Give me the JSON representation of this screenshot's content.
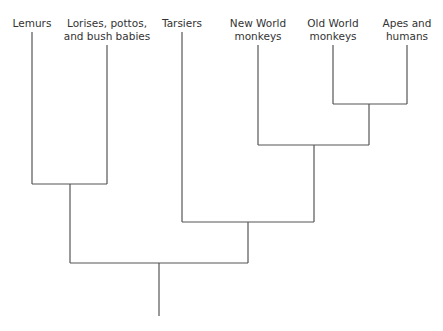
{
  "diagram": {
    "type": "cladogram",
    "taxa": [
      {
        "line1": "Lemurs",
        "line2": ""
      },
      {
        "line1": "Lorises, pottos,",
        "line2": "and bush babies"
      },
      {
        "line1": "Tarsiers",
        "line2": ""
      },
      {
        "line1": "New World",
        "line2": "monkeys"
      },
      {
        "line1": "Old World",
        "line2": "monkeys"
      },
      {
        "line1": "Apes and",
        "line2": "humans"
      }
    ]
  }
}
